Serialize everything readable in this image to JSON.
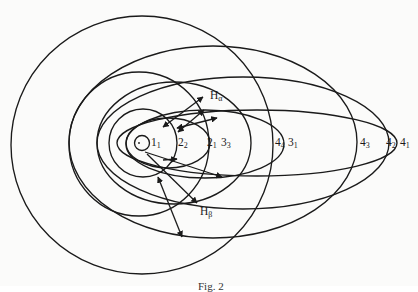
{
  "figure": {
    "caption": "Fig. 2",
    "nucleus": {
      "cx": 139,
      "cy": 143
    },
    "orbits": [
      {
        "id": "1_1",
        "n": 1,
        "k": 1,
        "shape": "circle",
        "cx": 142,
        "cy": 143,
        "rx": 7.5,
        "ry": 7.5
      },
      {
        "id": "2_2",
        "n": 2,
        "k": 2,
        "shape": "circle",
        "cx": 143,
        "cy": 143,
        "rx": 34,
        "ry": 34
      },
      {
        "id": "2_1",
        "n": 2,
        "k": 1,
        "shape": "ellipse",
        "cx": 168,
        "cy": 143,
        "rx": 42,
        "ry": 25
      },
      {
        "id": "3_3",
        "n": 3,
        "k": 3,
        "shape": "circle",
        "cx": 139,
        "cy": 144,
        "rx": 70,
        "ry": 72
      },
      {
        "id": "3_2",
        "n": 3,
        "k": 2,
        "shape": "ellipse",
        "cx": 174,
        "cy": 143,
        "rx": 77,
        "ry": 61
      },
      {
        "id": "3_1",
        "n": 3,
        "k": 1,
        "shape": "ellipse",
        "cx": 205,
        "cy": 144,
        "rx": 79,
        "ry": 34
      },
      {
        "id": "4_4",
        "n": 4,
        "k": 4,
        "shape": "circle",
        "cx": 142,
        "cy": 145,
        "rx": 131,
        "ry": 129
      },
      {
        "id": "4_3",
        "n": 4,
        "k": 3,
        "shape": "ellipse",
        "cx": 213,
        "cy": 142,
        "rx": 144,
        "ry": 96
      },
      {
        "id": "4_2",
        "n": 4,
        "k": 2,
        "shape": "ellipse",
        "cx": 243,
        "cy": 143,
        "rx": 146,
        "ry": 66
      },
      {
        "id": "4_1",
        "n": 4,
        "k": 1,
        "shape": "ellipse",
        "cx": 257,
        "cy": 143,
        "rx": 140,
        "ry": 33
      }
    ],
    "labels": [
      {
        "name": "label-1-1",
        "main": "1",
        "sub": "1",
        "x": 151,
        "y": 137
      },
      {
        "name": "label-2-2",
        "main": "2",
        "sub": "2",
        "x": 178,
        "y": 137
      },
      {
        "name": "label-2-1",
        "main": "2",
        "sub": "1",
        "x": 207,
        "y": 137
      },
      {
        "name": "label-3-3",
        "main": "3",
        "sub": "3",
        "x": 221,
        "y": 137
      },
      {
        "name": "label-4-4",
        "main": "4",
        "sub": "4",
        "x": 275,
        "y": 137
      },
      {
        "name": "label-3-1",
        "main": "3",
        "sub": "1",
        "x": 288,
        "y": 137
      },
      {
        "name": "label-4-3",
        "main": "4",
        "sub": "3",
        "x": 360,
        "y": 137
      },
      {
        "name": "label-4-2",
        "main": "4",
        "sub": "2",
        "x": 386,
        "y": 137
      },
      {
        "name": "label-4-1",
        "main": "4",
        "sub": "1",
        "x": 400,
        "y": 137
      },
      {
        "name": "label-h-alpha",
        "main": "H",
        "sub": "α",
        "x": 210,
        "y": 90
      },
      {
        "name": "label-h-beta",
        "main": "H",
        "sub": "β",
        "x": 200,
        "y": 206
      }
    ],
    "transitions": [
      {
        "series": "H-alpha",
        "from": [
          203,
          97
        ],
        "to": [
          163,
          127
        ],
        "heads": "both"
      },
      {
        "series": "H-alpha",
        "from": [
          204,
          110
        ],
        "to": [
          178,
          132
        ],
        "heads": "both"
      },
      {
        "series": "H-alpha",
        "from": [
          217,
          118
        ],
        "to": [
          177,
          128
        ],
        "heads": "both"
      },
      {
        "series": "H-alpha",
        "from": [
          145,
          152
        ],
        "to": [
          222,
          177
        ],
        "heads": "end"
      },
      {
        "series": "H-beta",
        "from": [
          147,
          154
        ],
        "to": [
          197,
          203
        ],
        "heads": "end"
      },
      {
        "series": "H-beta",
        "from": [
          158,
          177
        ],
        "to": [
          182,
          237
        ],
        "heads": "both"
      },
      {
        "series": "H-beta",
        "from": [
          163,
          160
        ],
        "to": [
          177,
          159
        ],
        "heads": "end"
      }
    ],
    "colors": {
      "ink": "#1a1a1a",
      "paper": "#fbfbfa",
      "bleed_through": "#e4e4e2"
    }
  }
}
